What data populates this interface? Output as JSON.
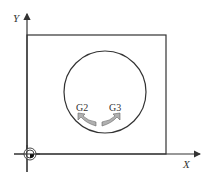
{
  "diagram": {
    "axes": {
      "x_label": "X",
      "y_label": "Y"
    },
    "arc_labels": {
      "cw": "G2",
      "ccw": "G3"
    },
    "colors": {
      "line": "#333333",
      "arrow_fill": "#b0b0b0",
      "arrow_stroke": "#666666"
    }
  }
}
